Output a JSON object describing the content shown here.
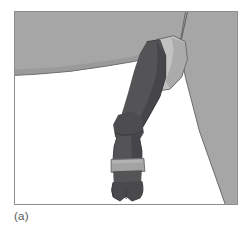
{
  "figure": {
    "caption": "(a)",
    "alt_description": "Line drawing of a horse's hind leg with a dark bandage wrap and a light strap above the hoof",
    "frame": {
      "border_color": "#8d8d8d",
      "background_color": "#ffffff",
      "x": 14,
      "y": 11,
      "width": 224,
      "height": 194
    },
    "palette": {
      "body_gray": "#a6a6a6",
      "body_gray_shadow": "#9a9a9a",
      "light_leg_gray": "#c2c2c2",
      "light_leg_shadow": "#ababab",
      "dark_wrap": "#545456",
      "dark_wrap_shadow": "#46464a",
      "strap_gray": "#a3a3a3",
      "outline": "#3d3d3f",
      "background": "#ffffff",
      "caption_text": "#58585a"
    },
    "parts": [
      {
        "name": "horse-body-upper",
        "label": "Body / flank",
        "fill": "#a6a6a6"
      },
      {
        "name": "horse-hindquarter",
        "label": "Hindquarter wedge",
        "fill": "#a6a6a6"
      },
      {
        "name": "upper-leg-gaskin",
        "label": "Upper leg (gaskin)",
        "fill": "#c2c2c2"
      },
      {
        "name": "bandage-wrap",
        "label": "Dark leg bandage wrap",
        "fill": "#545456"
      },
      {
        "name": "hock-joint",
        "label": "Hock joint",
        "fill": "#4d4d50"
      },
      {
        "name": "pastern-strap",
        "label": "Light strap above hoof",
        "fill": "#a3a3a3"
      },
      {
        "name": "hoof",
        "label": "Hoof",
        "fill": "#4a4a4d"
      }
    ]
  }
}
